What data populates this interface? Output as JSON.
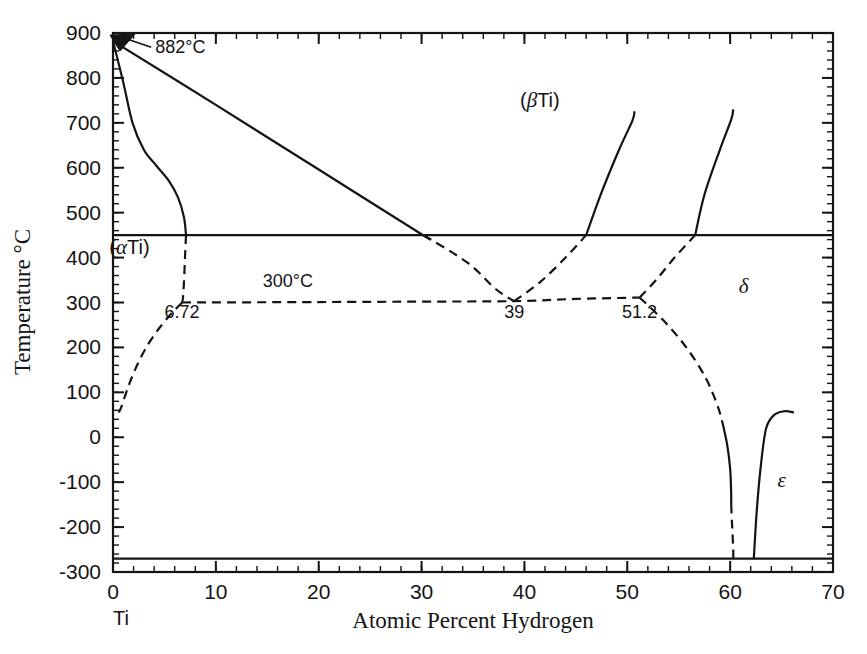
{
  "figure": {
    "kind": "binary-phase-diagram",
    "system": "Ti-H",
    "background": "#ffffff",
    "line_color": "#141414"
  },
  "axes": {
    "x": {
      "label": "Atomic Percent Hydrogen",
      "min": 0,
      "max": 70,
      "major_ticks": [
        0,
        10,
        20,
        30,
        40,
        50,
        60,
        70
      ],
      "tick_labels": [
        "0",
        "10",
        "20",
        "30",
        "40",
        "50",
        "60",
        "70"
      ],
      "minor_interval": 2,
      "origin_element_label": "Ti"
    },
    "y": {
      "label": "Temperature °C",
      "min": -300,
      "max": 900,
      "major_ticks": [
        -300,
        -200,
        -100,
        0,
        100,
        200,
        300,
        400,
        500,
        600,
        700,
        800,
        900
      ],
      "tick_labels": [
        "-300",
        "-200",
        "-100",
        "0",
        "100",
        "200",
        "300",
        "400",
        "500",
        "600",
        "700",
        "800",
        "900"
      ],
      "minor_interval": 20
    }
  },
  "annotations": [
    {
      "id": "allotropic-point",
      "text": "882°C",
      "x_pct": 0,
      "temp_c": 882,
      "label_x_pct": 4.1,
      "label_temp_c": 855
    },
    {
      "id": "eutectoid-temp",
      "text": "300°C",
      "x_pct": 17.0,
      "temp_c": 335
    },
    {
      "id": "alpha-eutectoid-comp",
      "text": "6.72",
      "x_pct": 6.72,
      "temp_c": 265
    },
    {
      "id": "eutectoid-comp",
      "text": "39",
      "x_pct": 39,
      "temp_c": 265
    },
    {
      "id": "delta-eutectoid-comp",
      "text": "51.2",
      "x_pct": 51.2,
      "temp_c": 265
    }
  ],
  "phase_labels": [
    {
      "id": "beta-ti",
      "text": "(βTi)",
      "x_pct": 41.5,
      "temp_c": 735,
      "style": "greek-paren"
    },
    {
      "id": "alpha-ti",
      "text": "(αTi)",
      "x_pct": 1.6,
      "temp_c": 408,
      "style": "greek-paren"
    },
    {
      "id": "delta",
      "text": "δ",
      "x_pct": 61.3,
      "temp_c": 322,
      "style": "greek"
    },
    {
      "id": "epsilon",
      "text": "ε",
      "x_pct": 65.0,
      "temp_c": -110,
      "style": "greek"
    }
  ],
  "chart_data": {
    "type": "line",
    "xlabel": "Atomic Percent Hydrogen",
    "ylabel": "Temperature °C",
    "xlim": [
      0,
      70
    ],
    "ylim": [
      -300,
      900
    ],
    "grid": false,
    "legend": "none",
    "boundaries": [
      {
        "name": "alpha-beta-transus-upper",
        "style": "solid",
        "points": [
          [
            0,
            882
          ],
          [
            1.0,
            790
          ],
          [
            1.9,
            700
          ],
          [
            3.0,
            640
          ],
          [
            4.2,
            605
          ],
          [
            5.4,
            572
          ],
          [
            6.3,
            535
          ],
          [
            6.9,
            490
          ],
          [
            7.1,
            450
          ]
        ]
      },
      {
        "name": "beta-liquidus-descending",
        "style": "solid",
        "points": [
          [
            0,
            882
          ],
          [
            10,
            740
          ],
          [
            20,
            596
          ],
          [
            30,
            452
          ],
          [
            30.2,
            450
          ]
        ]
      },
      {
        "name": "beta-transus-to-eutectoid",
        "style": "dashed",
        "points": [
          [
            30.2,
            450
          ],
          [
            34.5,
            388
          ],
          [
            37.2,
            330
          ],
          [
            39,
            303
          ]
        ]
      },
      {
        "name": "alpha-solvus-to-eutectoid",
        "style": "dashed",
        "points": [
          [
            7.1,
            450
          ],
          [
            7.0,
            400
          ],
          [
            6.9,
            345
          ],
          [
            6.8,
            310
          ],
          [
            6.72,
            300
          ]
        ]
      },
      {
        "name": "alpha-solvus-lower",
        "style": "dashed",
        "points": [
          [
            6.72,
            300
          ],
          [
            5.7,
            276
          ],
          [
            4.6,
            246
          ],
          [
            3.5,
            210
          ],
          [
            2.5,
            168
          ],
          [
            1.6,
            120
          ],
          [
            0.85,
            70
          ],
          [
            0.55,
            55
          ]
        ]
      },
      {
        "name": "eutectoid-horizontal",
        "style": "dashed",
        "temp_c": 300,
        "points": [
          [
            6.72,
            300
          ],
          [
            20,
            301
          ],
          [
            30,
            302
          ],
          [
            39,
            303
          ],
          [
            45,
            308
          ],
          [
            51.2,
            311
          ]
        ]
      },
      {
        "name": "delta-solvus-left-solid",
        "style": "solid",
        "points": [
          [
            46.0,
            450
          ],
          [
            47.5,
            545
          ],
          [
            49.2,
            640
          ],
          [
            50.5,
            705
          ],
          [
            50.7,
            726
          ]
        ]
      },
      {
        "name": "delta-solvus-left-dashed",
        "style": "dashed",
        "points": [
          [
            39,
            303
          ],
          [
            41.5,
            345
          ],
          [
            44.0,
            400
          ],
          [
            46.0,
            450
          ]
        ]
      },
      {
        "name": "delta-solvus-right-solid",
        "style": "solid",
        "points": [
          [
            56.6,
            450
          ],
          [
            57.5,
            540
          ],
          [
            59.0,
            640
          ],
          [
            60.1,
            707
          ],
          [
            60.3,
            730
          ]
        ]
      },
      {
        "name": "delta-solvus-right-dashed",
        "style": "dashed",
        "points": [
          [
            51.2,
            311
          ],
          [
            52.8,
            350
          ],
          [
            54.6,
            400
          ],
          [
            56.6,
            450
          ]
        ]
      },
      {
        "name": "delta-epsilon-boundary-dashed-upper",
        "style": "dashed",
        "points": [
          [
            51.2,
            311
          ],
          [
            53.6,
            258
          ],
          [
            55.8,
            198
          ],
          [
            57.6,
            133
          ],
          [
            58.7,
            75
          ],
          [
            59.2,
            38
          ]
        ]
      },
      {
        "name": "delta-epsilon-boundary-solid",
        "style": "solid",
        "points": [
          [
            59.2,
            38
          ],
          [
            59.7,
            -15
          ],
          [
            60.0,
            -70
          ],
          [
            60.1,
            -125
          ],
          [
            60.1,
            -150
          ]
        ]
      },
      {
        "name": "delta-epsilon-boundary-dashed-lower",
        "style": "dashed",
        "points": [
          [
            60.1,
            -150
          ],
          [
            60.2,
            -200
          ],
          [
            60.3,
            -250
          ],
          [
            60.3,
            -270
          ]
        ]
      },
      {
        "name": "epsilon-phase-field",
        "style": "solid",
        "points": [
          [
            62.3,
            -270
          ],
          [
            62.6,
            -160
          ],
          [
            63.0,
            -60
          ],
          [
            63.5,
            20
          ],
          [
            64.3,
            50
          ],
          [
            65.3,
            58
          ],
          [
            66.2,
            55
          ]
        ]
      },
      {
        "name": "alpha-beta-invariant-horizontal",
        "style": "solid",
        "temp_c": 450,
        "points": [
          [
            0,
            450
          ],
          [
            70,
            450
          ]
        ]
      },
      {
        "name": "lower-invariant-horizontal",
        "style": "solid",
        "temp_c": -270,
        "points": [
          [
            0,
            -270
          ],
          [
            70,
            -270
          ]
        ]
      }
    ]
  }
}
